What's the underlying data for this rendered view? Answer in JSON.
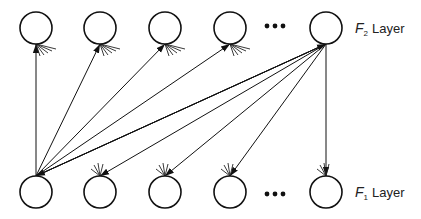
{
  "diagram": {
    "top_layer": {
      "label_var": "F",
      "label_sub": "2",
      "label_text": "Layer",
      "nodes": [
        {
          "x": 36,
          "y": 28
        },
        {
          "x": 100,
          "y": 28
        },
        {
          "x": 165,
          "y": 28
        },
        {
          "x": 230,
          "y": 28
        },
        {
          "x": 326,
          "y": 28
        }
      ],
      "ellipsis_x": 275
    },
    "bottom_layer": {
      "label_var": "F",
      "label_sub": "1",
      "label_text": "Layer",
      "nodes": [
        {
          "x": 36,
          "y": 192
        },
        {
          "x": 100,
          "y": 192
        },
        {
          "x": 165,
          "y": 192
        },
        {
          "x": 230,
          "y": 192
        },
        {
          "x": 326,
          "y": 192
        }
      ],
      "ellipsis_x": 275
    },
    "node_radius": 16,
    "edges_up": [
      {
        "from": "F1.0",
        "to": "F2.0"
      },
      {
        "from": "F1.0",
        "to": "F2.1"
      },
      {
        "from": "F1.0",
        "to": "F2.2"
      },
      {
        "from": "F1.0",
        "to": "F2.3"
      },
      {
        "from": "F1.0",
        "to": "F2.4"
      }
    ],
    "edges_down": [
      {
        "from": "F2.4",
        "to": "F1.0"
      },
      {
        "from": "F2.4",
        "to": "F1.1"
      },
      {
        "from": "F2.4",
        "to": "F1.2"
      },
      {
        "from": "F2.4",
        "to": "F1.3"
      },
      {
        "from": "F2.4",
        "to": "F1.4"
      }
    ]
  }
}
